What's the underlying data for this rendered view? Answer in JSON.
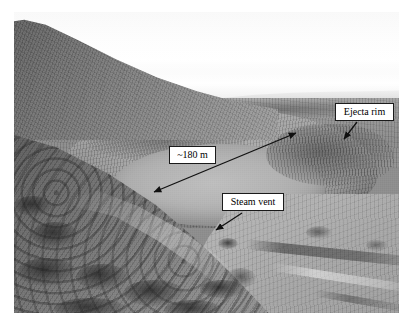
{
  "figure": {
    "type": "annotated-photograph",
    "frame": {
      "x": 14,
      "y": 12,
      "width": 385,
      "height": 301
    }
  },
  "annotations": {
    "ejecta_rim": {
      "label": "Ejecta rim",
      "box": {
        "x": 335,
        "y": 103,
        "width": 59,
        "height": 18
      },
      "arrow": {
        "from_x": 357,
        "from_y": 122,
        "to_x": 343,
        "to_y": 140
      },
      "arrow_heads": "single"
    },
    "distance": {
      "label": "~180 m",
      "box": {
        "x": 169,
        "y": 146,
        "width": 47,
        "height": 18
      },
      "arrow": {
        "from_x": 152,
        "from_y": 193,
        "to_x": 298,
        "to_y": 132
      },
      "arrow_heads": "double",
      "measurement_value": 180,
      "measurement_unit": "m",
      "measurement_qualifier": "~"
    },
    "steam_vent": {
      "label": "Steam vent",
      "box": {
        "x": 222,
        "y": 193,
        "width": 62,
        "height": 18
      },
      "arrow": {
        "from_x": 242,
        "from_y": 213,
        "to_x": 215,
        "to_y": 231
      },
      "arrow_heads": "single"
    }
  },
  "colors": {
    "background": "#ffffff",
    "label_fill": "#ffffff",
    "label_border": "#1a1a1a",
    "label_text": "#000000",
    "arrow": "#111111"
  },
  "scene": {
    "sky": "bright overcast sky",
    "features": [
      "dark ridge descending from upper left",
      "distant plateau along horizon",
      "circular crater basin in middle distance",
      "dark ejecta rim on right flank",
      "bright plain with tracks at lower right",
      "dark shrub-covered slope in left foreground"
    ]
  }
}
